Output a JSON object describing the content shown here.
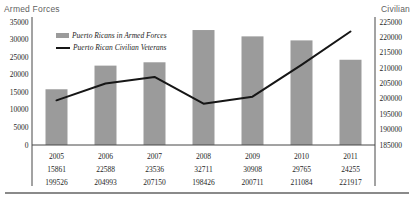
{
  "chart_data": {
    "type": "combo",
    "categories": [
      "2005",
      "2006",
      "2007",
      "2008",
      "2009",
      "2010",
      "2011"
    ],
    "series": [
      {
        "name": "Puerto Ricans in Armed Forces",
        "type": "bar",
        "axis": "left",
        "color": "#9b9b9b",
        "values": [
          15861,
          22588,
          23536,
          32711,
          30908,
          29765,
          24255
        ]
      },
      {
        "name": "Puerto Rican Civilian Veterans",
        "type": "line",
        "axis": "right",
        "color": "#161616",
        "values": [
          199526,
          204993,
          207150,
          198426,
          200711,
          211084,
          221917
        ]
      }
    ],
    "left_axis": {
      "title": "Armed Forces",
      "min": 0,
      "max": 35000,
      "step": 5000,
      "tick_labels": [
        "0",
        "5000",
        "10000",
        "15000",
        "20000",
        "25000",
        "30000",
        "35000"
      ]
    },
    "right_axis": {
      "title": "Civilian",
      "min": 185000,
      "max": 225000,
      "step": 5000,
      "tick_labels": [
        "185000",
        "190000",
        "195000",
        "200000",
        "205000",
        "210000",
        "215000",
        "220000",
        "225000"
      ]
    },
    "legend_position": "top-left-inside",
    "grid": false,
    "show_data_table": true
  }
}
